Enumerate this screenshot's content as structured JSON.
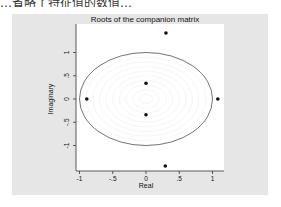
{
  "header_fragment": "…省略了特征值的数值…",
  "chart_data": {
    "type": "scatter",
    "title": "Roots of the companion matrix",
    "xlabel": "Real",
    "ylabel": "Imaginary",
    "xlim": [
      -1.1,
      1.15
    ],
    "ylim": [
      -1.55,
      1.6
    ],
    "x_ticks": [
      -1,
      -0.5,
      0,
      0.5,
      1
    ],
    "x_tick_labels": [
      "-1",
      "-.5",
      "0",
      ".5",
      "1"
    ],
    "y_ticks": [
      -1,
      -0.5,
      0,
      0.5,
      1
    ],
    "y_tick_labels": [
      "-1",
      "-.5",
      "0",
      ".5",
      "1"
    ],
    "grid": false,
    "unit_circle": true,
    "points": [
      {
        "x": 0.3,
        "y": 1.42
      },
      {
        "x": 0.29,
        "y": -1.44
      },
      {
        "x": -0.89,
        "y": 0.0
      },
      {
        "x": 1.08,
        "y": 0.0
      },
      {
        "x": 0.0,
        "y": 0.34
      },
      {
        "x": 0.0,
        "y": -0.34
      }
    ]
  },
  "colors": {
    "panel_bg": "#e6e6e6",
    "plot_bg": "#ffffff",
    "circle": "#555555",
    "points": "#111111"
  }
}
